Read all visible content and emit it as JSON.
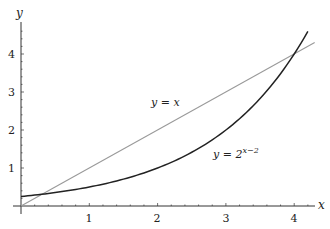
{
  "chart_data": {
    "type": "line",
    "title": "",
    "xlabel": "x",
    "ylabel": "y",
    "xlim": [
      -0.05,
      4.35
    ],
    "ylim": [
      -0.1,
      4.8
    ],
    "grid": false,
    "legend": "none",
    "x_ticks": [
      "1",
      "2",
      "3",
      "4"
    ],
    "y_ticks": [
      "1",
      "2",
      "3",
      "4"
    ],
    "series": [
      {
        "name": "y = x",
        "function": "x",
        "color": "#9a9a9a",
        "x": [
          0,
          4.3
        ],
        "y": [
          0,
          4.3
        ]
      },
      {
        "name": "y = 2^(x-2)",
        "function": "2^(x-2)",
        "color": "#222222",
        "x": [
          0,
          0.5,
          1,
          1.5,
          2,
          2.5,
          3,
          3.5,
          4,
          4.2
        ],
        "y": [
          0.25,
          0.354,
          0.5,
          0.707,
          1,
          1.414,
          2,
          2.828,
          4,
          4.595
        ]
      }
    ],
    "annotations": [
      {
        "text": "y = x",
        "x": 2.1,
        "y": 2.7
      },
      {
        "text": "y = 2",
        "superscript": "x−2",
        "x": 2.8,
        "y": 1.0
      }
    ]
  }
}
